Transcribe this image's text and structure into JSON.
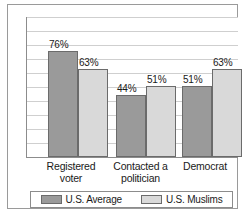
{
  "chart_data": {
    "type": "bar",
    "title": "",
    "subtitle": "",
    "xlabel": "",
    "ylabel": "",
    "ylim": [
      0,
      100
    ],
    "grid": true,
    "gridline_step": 10,
    "legend_position": "bottom",
    "categories": [
      "Registered voter",
      "Contacted a politician",
      "Democrat"
    ],
    "series": [
      {
        "name": "U.S. Average",
        "color": "#9a9a9a",
        "values": [
          76,
          63,
          51
        ],
        "labels": [
          "76%",
          "63%",
          "51%"
        ]
      },
      {
        "name": "U.S. Muslims",
        "color": "#d9d9d9",
        "values": [
          63,
          51,
          63
        ],
        "labels": [
          "63%",
          "51%",
          "63%"
        ]
      }
    ],
    "bar_labels": [
      {
        "text": "76%",
        "series": "U.S. Average",
        "category": "Registered voter"
      },
      {
        "text": "63%",
        "series": "U.S. Muslims",
        "category": "Registered voter"
      },
      {
        "text": "44%",
        "series": "U.S. Average",
        "category": "Contacted a politician"
      },
      {
        "text": "51%",
        "series": "U.S. Muslims",
        "category": "Contacted a politician"
      },
      {
        "text": "51%",
        "series": "U.S. Average",
        "category": "Democrat"
      },
      {
        "text": "63%",
        "series": "U.S. Muslims",
        "category": "Democrat"
      }
    ]
  },
  "axis": {
    "category_labels": [
      {
        "line1": "Registered",
        "line2": "voter"
      },
      {
        "line1": "Contacted a",
        "line2": "politician"
      },
      {
        "line1": "Democrat",
        "line2": ""
      }
    ]
  },
  "legend": {
    "items": [
      {
        "label": "U.S. Average",
        "color": "#9a9a9a"
      },
      {
        "label": "U.S. Muslims",
        "color": "#d9d9d9"
      }
    ]
  },
  "bars": [
    {
      "value": 76,
      "label": "76%",
      "series": "dark",
      "left": 21,
      "width": 30
    },
    {
      "value": 63,
      "label": "63%",
      "series": "light",
      "left": 51,
      "width": 30
    },
    {
      "value": 44,
      "label": "44%",
      "series": "dark",
      "left": 89,
      "width": 30
    },
    {
      "value": 51,
      "label": "51%",
      "series": "light",
      "left": 119,
      "width": 30
    },
    {
      "value": 51,
      "label": "51%",
      "series": "dark",
      "left": 155,
      "width": 30
    },
    {
      "value": 63,
      "label": "63%",
      "series": "light",
      "left": 185,
      "width": 30
    }
  ]
}
